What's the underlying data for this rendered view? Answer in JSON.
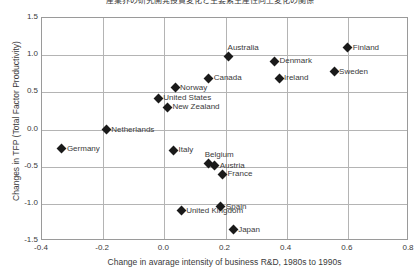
{
  "chart_data": {
    "type": "scatter",
    "title": "産業界の研究開発投資変化と主要素生産性向上変化の関係",
    "xlabel": "Change in avarage intensity of business R&D, 1980s to 1990s",
    "ylabel": "Changes in TFP (Total Factor Productivity)",
    "xlim": [
      -0.4,
      0.8
    ],
    "ylim": [
      -1.5,
      1.5
    ],
    "xticks": [
      "-0.4",
      "-0.2",
      "0.0",
      "0.2",
      "0.4",
      "0.6",
      "0.8"
    ],
    "xtick_values": [
      -0.4,
      -0.2,
      0.0,
      0.2,
      0.4,
      0.6,
      0.8
    ],
    "yticks": [
      "1.5",
      "1.0",
      "0.5",
      "0.0",
      "-0.5",
      "-1.0",
      "-1.5"
    ],
    "ytick_values": [
      1.5,
      1.0,
      0.5,
      0.0,
      -0.5,
      -1.0,
      -1.5
    ],
    "grid": true,
    "legend": "none",
    "marker": "filled-diamond",
    "marker_color": "#1a1a1a",
    "points": [
      {
        "label": "Finland",
        "x": 0.6,
        "y": 1.1,
        "pos": "right"
      },
      {
        "label": "Australia",
        "x": 0.21,
        "y": 0.98,
        "pos": "above"
      },
      {
        "label": "Denmark",
        "x": 0.36,
        "y": 0.92,
        "pos": "right"
      },
      {
        "label": "Sweden",
        "x": 0.555,
        "y": 0.78,
        "pos": "right"
      },
      {
        "label": "Canada",
        "x": 0.145,
        "y": 0.69,
        "pos": "right"
      },
      {
        "label": "Ireland",
        "x": 0.375,
        "y": 0.69,
        "pos": "right"
      },
      {
        "label": "Norway",
        "x": 0.035,
        "y": 0.56,
        "pos": "right"
      },
      {
        "label": "United States",
        "x": -0.02,
        "y": 0.42,
        "pos": "right"
      },
      {
        "label": "New Zealand",
        "x": 0.01,
        "y": 0.3,
        "pos": "right"
      },
      {
        "label": "Netherlands",
        "x": -0.19,
        "y": 0.0,
        "pos": "right"
      },
      {
        "label": "Germany",
        "x": -0.335,
        "y": -0.26,
        "pos": "right"
      },
      {
        "label": "Italy",
        "x": 0.03,
        "y": -0.28,
        "pos": "right"
      },
      {
        "label": "Belgium",
        "x": 0.145,
        "y": -0.46,
        "pos": "above-l"
      },
      {
        "label": "Austria",
        "x": 0.165,
        "y": -0.49,
        "pos": "right"
      },
      {
        "label": "France",
        "x": 0.19,
        "y": -0.6,
        "pos": "right"
      },
      {
        "label": "United Kingdom",
        "x": 0.055,
        "y": -1.09,
        "pos": "right"
      },
      {
        "label": "Spain",
        "x": 0.185,
        "y": -1.04,
        "pos": "right"
      },
      {
        "label": "Japan",
        "x": 0.225,
        "y": -1.35,
        "pos": "right"
      }
    ]
  }
}
